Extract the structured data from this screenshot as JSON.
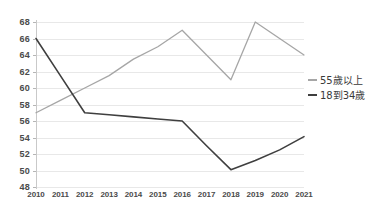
{
  "chart_data": {
    "type": "line",
    "title": "",
    "subtitle": "",
    "xlabel": "",
    "ylabel": "",
    "x": [
      "2010",
      "2011",
      "2012",
      "2013",
      "2014",
      "2015",
      "2016",
      "2017",
      "2018",
      "2019",
      "2020",
      "2021"
    ],
    "categories": [
      "2010",
      "2011",
      "2012",
      "2013",
      "2014",
      "2015",
      "2016",
      "2017",
      "2018",
      "2019",
      "2020",
      "2021"
    ],
    "ylim": [
      48,
      68
    ],
    "ytick_step": 2,
    "yticks": [
      "68",
      "66",
      "64",
      "62",
      "60",
      "58",
      "56",
      "54",
      "52",
      "50",
      "48"
    ],
    "grid": true,
    "legend_position": "right",
    "series": [
      {
        "name": "55歲以上",
        "color": "#a6a6a6",
        "values": [
          57,
          58.5,
          60,
          61.5,
          63.5,
          65,
          67,
          64,
          61,
          68,
          66,
          64
        ]
      },
      {
        "name": "18到34歲",
        "color": "#3f3f3f",
        "values": [
          66,
          61.5,
          57,
          56.75,
          56.5,
          56.25,
          56,
          53,
          50.1,
          51.2,
          52.5,
          54.1
        ]
      }
    ]
  },
  "legend": {
    "items": [
      {
        "label": "55歲以上",
        "color": "#a6a6a6"
      },
      {
        "label": "18到34歲",
        "color": "#3f3f3f"
      }
    ]
  },
  "colors": {
    "series_older": "#a6a6a6",
    "series_younger": "#3f3f3f",
    "gridline": "#e8e8e8",
    "axis": "#c9c9c9",
    "tick_text": "#4a4a4a",
    "background": "#ffffff"
  }
}
